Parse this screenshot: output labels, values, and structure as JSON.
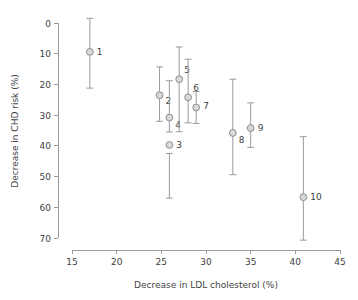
{
  "chart_data": {
    "type": "scatter",
    "title": "",
    "subtitle": "",
    "xlabel": "Decrease in LDL cholesterol (%)",
    "ylabel": "Decrease in CHD risk (%)",
    "xlim": [
      15,
      45
    ],
    "ylim": [
      0,
      70
    ],
    "y_axis_inverted": true,
    "grid": false,
    "legend": null,
    "xticks": [
      15,
      20,
      25,
      30,
      35,
      40,
      45
    ],
    "xtick_labels": [
      "15",
      "20",
      "25",
      "30",
      "35",
      "40",
      "45"
    ],
    "yticks": [
      0,
      10,
      20,
      30,
      40,
      50,
      60,
      70
    ],
    "ytick_labels": [
      "0",
      "10",
      "20",
      "30",
      "40",
      "50",
      "60",
      "70"
    ],
    "marker_style": "open-circle",
    "marker_fill": "#d8d8d8",
    "marker_stroke": "#8d8d8d",
    "errorbar_color": "#9b9b9b",
    "axis_color": "#9a9a9a",
    "text_color": "#3f3f3f",
    "points": [
      {
        "label": "1",
        "x": 17.0,
        "y": 9.4,
        "y_low": -1.5,
        "y_high": 21.2,
        "label_dx": 7,
        "label_dy": 3
      },
      {
        "label": "2",
        "x": 24.8,
        "y": 23.5,
        "y_low": 14.3,
        "y_high": 32.0,
        "label_dx": 6,
        "label_dy": 9
      },
      {
        "label": "3",
        "x": 25.9,
        "y": 39.7,
        "y_low": 57.0,
        "y_high": 42.5,
        "label_dx": 7,
        "label_dy": 3
      },
      {
        "label": "4",
        "x": 25.9,
        "y": 30.8,
        "y_low": 35.5,
        "y_high": 18.8,
        "label_dx": 6,
        "label_dy": 10
      },
      {
        "label": "5",
        "x": 27.0,
        "y": 18.3,
        "y_low": 35.4,
        "y_high": 7.8,
        "label_dx": 5,
        "label_dy": -6
      },
      {
        "label": "6",
        "x": 28.0,
        "y": 24.2,
        "y_low": 32.5,
        "y_high": 11.8,
        "label_dx": 5,
        "label_dy": -6
      },
      {
        "label": "7",
        "x": 28.9,
        "y": 27.5,
        "y_low": 32.7,
        "y_high": 22.3,
        "label_dx": 7,
        "label_dy": 2
      },
      {
        "label": "8",
        "x": 33.0,
        "y": 35.8,
        "y_low": 49.4,
        "y_high": 18.3,
        "label_dx": 6,
        "label_dy": 10
      },
      {
        "label": "9",
        "x": 35.0,
        "y": 34.2,
        "y_low": 40.5,
        "y_high": 26.0,
        "label_dx": 7,
        "label_dy": 3
      },
      {
        "label": "10",
        "x": 40.9,
        "y": 56.7,
        "y_low": 70.7,
        "y_high": 37.0,
        "label_dx": 7,
        "label_dy": 3
      }
    ]
  },
  "axes": {
    "x_title": "Decrease in LDL cholesterol (%)",
    "y_title": "Decrease in CHD risk (%)"
  }
}
